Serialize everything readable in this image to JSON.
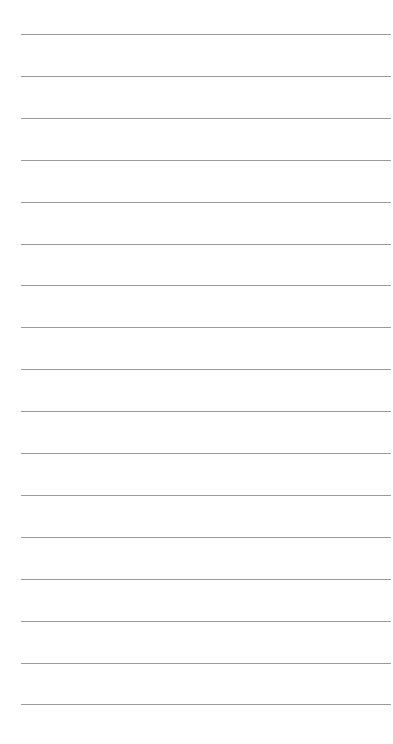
{
  "page": {
    "type": "lined-paper",
    "line_count": 17,
    "line_color": "#8a8a8a",
    "background_color": "#ffffff",
    "lines": [
      "",
      "",
      "",
      "",
      "",
      "",
      "",
      "",
      "",
      "",
      "",
      "",
      "",
      "",
      "",
      "",
      ""
    ]
  }
}
